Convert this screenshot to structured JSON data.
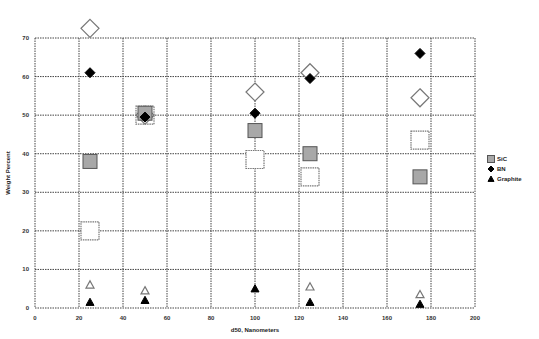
{
  "chart_data": {
    "type": "scatter",
    "title": "",
    "xlabel": "d50, Nanometers",
    "ylabel": "Weight Percent",
    "xlim": [
      0,
      200
    ],
    "ylim": [
      0,
      70
    ],
    "xticks": [
      0,
      20,
      40,
      60,
      80,
      100,
      120,
      140,
      160,
      180,
      200
    ],
    "yticks": [
      0,
      10,
      20,
      30,
      40,
      50,
      60,
      70
    ],
    "grid": true,
    "legend_position": "right",
    "legend": [
      {
        "label": "SiC",
        "marker": "square",
        "fill": "#a8a8a8"
      },
      {
        "label": "BN",
        "marker": "diamond",
        "fill": "#000000"
      },
      {
        "label": "Graphite",
        "marker": "triangle",
        "fill": "#000000"
      }
    ],
    "series": [
      {
        "name": "SiC",
        "marker": "square",
        "fill": "#a8a8a8",
        "size": 7,
        "points": [
          [
            25,
            38
          ],
          [
            50,
            50.5
          ],
          [
            100,
            46
          ],
          [
            125,
            40
          ],
          [
            175,
            34
          ]
        ]
      },
      {
        "name": "SiC (open)",
        "marker": "square",
        "fill": "none",
        "size": 9,
        "points": [
          [
            25,
            20
          ],
          [
            50,
            50
          ],
          [
            100,
            38.5
          ],
          [
            125,
            34
          ],
          [
            175,
            43.5
          ]
        ]
      },
      {
        "name": "BN",
        "marker": "diamond",
        "fill": "#000000",
        "size": 5,
        "points": [
          [
            25,
            61
          ],
          [
            50,
            49.5
          ],
          [
            100,
            50.5
          ],
          [
            125,
            59.5
          ],
          [
            175,
            66
          ]
        ]
      },
      {
        "name": "BN (open)",
        "marker": "diamond",
        "fill": "none",
        "size": 9,
        "points": [
          [
            25,
            72.5
          ],
          [
            50,
            50
          ],
          [
            100,
            56
          ],
          [
            125,
            61
          ],
          [
            175,
            54.5
          ]
        ]
      },
      {
        "name": "Graphite",
        "marker": "triangle",
        "fill": "#000000",
        "size": 4,
        "points": [
          [
            25,
            1.5
          ],
          [
            50,
            2
          ],
          [
            100,
            5
          ],
          [
            125,
            1.5
          ],
          [
            175,
            1
          ]
        ]
      },
      {
        "name": "Graphite (open)",
        "marker": "triangle",
        "fill": "none",
        "size": 4,
        "points": [
          [
            25,
            6
          ],
          [
            50,
            4.5
          ],
          [
            125,
            5.5
          ],
          [
            175,
            3.5
          ]
        ]
      }
    ]
  }
}
